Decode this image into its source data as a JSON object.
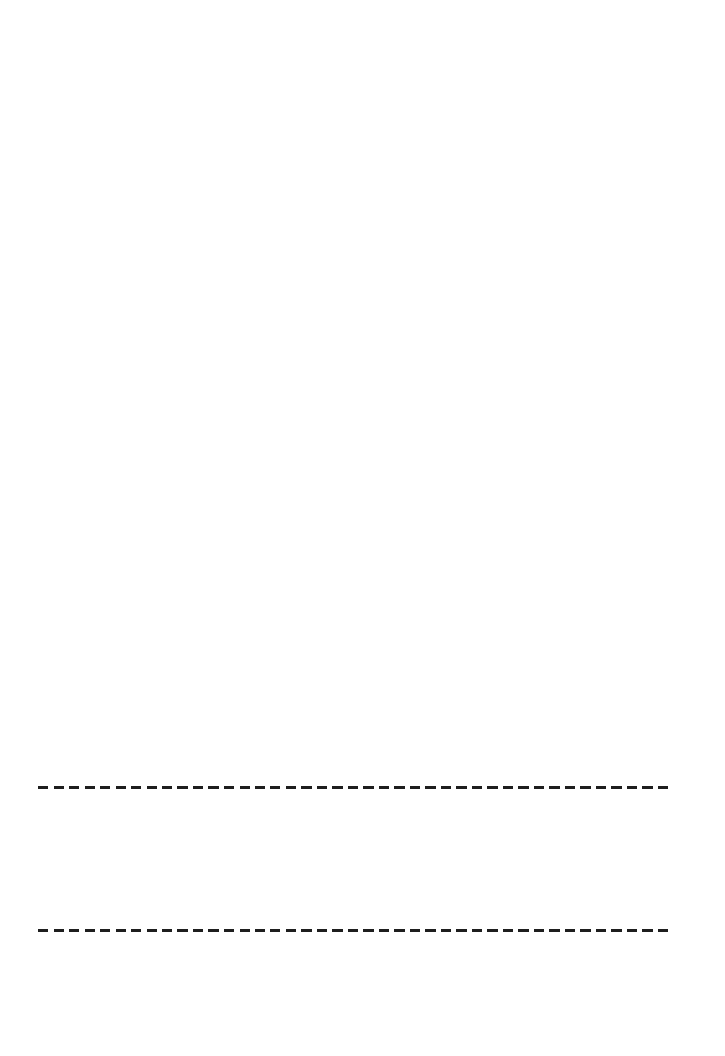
{
  "document": {
    "background_color": "#ffffff",
    "text_content": "",
    "lines": [
      {
        "style": "dashed",
        "color": "#1e1e1e",
        "top": 786,
        "left": 38,
        "width": 632,
        "thickness": 3
      },
      {
        "style": "dashed",
        "color": "#1e1e1e",
        "top": 929,
        "left": 38,
        "width": 632,
        "thickness": 3
      }
    ]
  }
}
